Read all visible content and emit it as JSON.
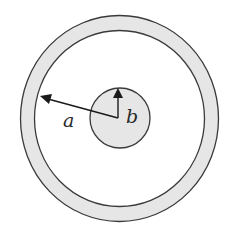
{
  "diagram": {
    "labels": {
      "outer_radius": "a",
      "inner_radius": "b"
    },
    "colors": {
      "fill": "#e6e6e6",
      "stroke": "#3a3a3a",
      "background": "#ffffff"
    }
  }
}
